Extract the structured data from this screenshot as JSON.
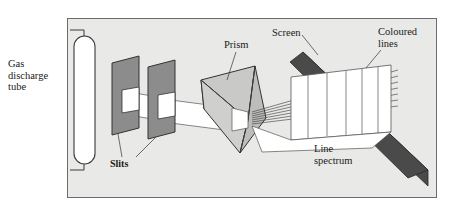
{
  "figure": {
    "type": "optics-diagram",
    "background_color": "#e9e9e7",
    "page_color": "#ffffff",
    "border_color": "#6c6c6c"
  },
  "labels": {
    "gas_discharge_tube": "Gas\ndischarge\ntube",
    "slits": "Slits",
    "prism": "Prism",
    "screen": "Screen",
    "coloured_lines": "Coloured\nlines",
    "line_spectrum": "Line\nspectrum"
  },
  "components": {
    "tube": {
      "name": "gas-discharge-tube",
      "shape": "capsule",
      "fill": "#ffffff",
      "stroke": "#333333"
    },
    "slit_plate_1": {
      "name": "first-slit-plate",
      "fill": "#8c8c8c",
      "aperture_fill": "#ffffff"
    },
    "slit_plate_2": {
      "name": "second-slit-plate",
      "fill": "#8c8c8c",
      "aperture_fill": "#ffffff"
    },
    "beam": {
      "name": "light-beam",
      "fill": "#ffffff",
      "stroke": "#444444"
    },
    "prism": {
      "name": "triangular-prism",
      "face_front_fill": "#c9c9c7",
      "face_right_fill": "#bdbdbb",
      "face_top_fill": "#d7d7d5",
      "stroke": "#333333"
    },
    "screen": {
      "name": "projection-screen",
      "fill": "#4a4a4a",
      "stroke": "#2a2a2a"
    },
    "spectrum_panel": {
      "name": "line-spectrum-panel",
      "fill": "#ffffff",
      "stroke": "#555555",
      "line_count": 5
    },
    "rays": {
      "name": "dispersed-light-rays",
      "stroke": "#444444",
      "count": 7
    }
  }
}
